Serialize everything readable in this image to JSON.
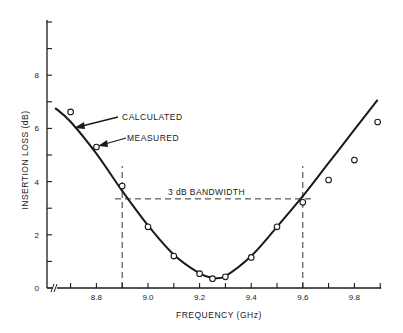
{
  "chart_data": {
    "type": "line",
    "title": "",
    "xlabel": "FREQUENCY (GHz)",
    "ylabel": "INSERTION LOSS (dB)",
    "xlim": [
      8.63,
      9.9
    ],
    "ylim": [
      0,
      10
    ],
    "grid": false,
    "x_axis_break": true,
    "x_tick_labels": [
      "8.8",
      "9.0",
      "9.2",
      "9.4",
      "9.6",
      "9.8"
    ],
    "x_ticks": [
      8.7,
      8.8,
      8.9,
      9.0,
      9.1,
      9.2,
      9.3,
      9.4,
      9.5,
      9.6,
      9.7,
      9.8,
      9.9
    ],
    "y_tick_labels": [
      "0",
      "2",
      "4",
      "6",
      "8"
    ],
    "y_ticks": [
      0,
      1,
      2,
      3,
      4,
      5,
      6,
      7,
      8,
      9,
      10
    ],
    "series": [
      {
        "name": "CALCULATED",
        "style": "solid-line",
        "x": [
          8.64,
          8.7,
          8.8,
          8.9,
          9.0,
          9.1,
          9.2,
          9.25,
          9.3,
          9.4,
          9.5,
          9.6,
          9.7,
          9.8,
          9.89
        ],
        "y": [
          6.77,
          6.25,
          5.05,
          3.65,
          2.35,
          1.25,
          0.55,
          0.38,
          0.45,
          1.2,
          2.3,
          3.45,
          4.7,
          5.95,
          7.07
        ]
      },
      {
        "name": "MEASURED",
        "style": "open-circle-markers",
        "x": [
          8.7,
          8.8,
          8.9,
          9.0,
          9.1,
          9.2,
          9.25,
          9.3,
          9.4,
          9.5,
          9.6,
          9.7,
          9.8,
          9.89
        ],
        "y": [
          6.62,
          5.3,
          3.83,
          2.3,
          1.2,
          0.54,
          0.35,
          0.42,
          1.15,
          2.3,
          3.22,
          4.06,
          4.81,
          6.24
        ]
      }
    ],
    "annotations": [
      {
        "text": "CALCULATED",
        "type": "arrow-label",
        "points_to": "CALCULATED curve"
      },
      {
        "text": "MEASURED",
        "type": "arrow-label",
        "points_to": "MEASURED point at 8.8 GHz"
      },
      {
        "text": "3 dB BANDWIDTH",
        "type": "dashed-bracket",
        "level_db": 3.35,
        "x_from": 8.9,
        "x_to": 9.6
      }
    ],
    "reference_lines": [
      {
        "orientation": "vertical",
        "x": 8.9,
        "style": "dashed"
      },
      {
        "orientation": "vertical",
        "x": 9.6,
        "style": "dashed"
      },
      {
        "orientation": "horizontal",
        "y": 3.35,
        "style": "dashed"
      }
    ]
  },
  "labels": {
    "calculated": "CALCULATED",
    "measured": "MEASURED",
    "bandwidth": "3 dB BANDWIDTH",
    "xlabel": "FREQUENCY (GHz)",
    "ylabel": "INSERTION LOSS (dB)",
    "axis_break": "//"
  },
  "colors": {
    "ink": "#1a1a1a",
    "background": "#ffffff"
  }
}
